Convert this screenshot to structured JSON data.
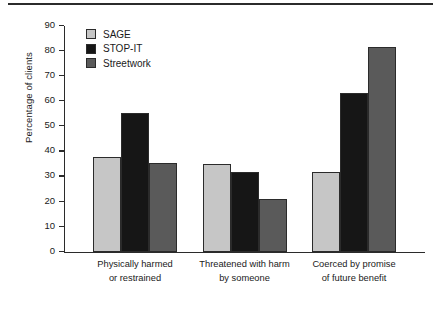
{
  "chart_data": {
    "type": "bar",
    "title": "",
    "xlabel": "",
    "ylabel": "Percentage of clients",
    "ylim": [
      0,
      90
    ],
    "yticks": [
      0,
      10,
      20,
      30,
      40,
      50,
      60,
      70,
      80,
      90
    ],
    "grid": false,
    "legend_position": "top-left inside plot",
    "categories": [
      "Physically  harmed\nor restrained",
      "Threatened with harm\nby someone",
      "Coerced by promise\nof future benefit"
    ],
    "category_lines": [
      [
        "Physically   harmed",
        "or restrained"
      ],
      [
        "Threatened with harm",
        "by someone"
      ],
      [
        "Coerced by promise",
        "of future benefit"
      ]
    ],
    "series": [
      {
        "name": "SAGE",
        "color": "#c6c6c6",
        "values": [
          38,
          35,
          32
        ]
      },
      {
        "name": "STOP-IT",
        "color": "#161616",
        "values": [
          55.5,
          32,
          63.5
        ]
      },
      {
        "name": "Streetwork",
        "color": "#5a5a5a",
        "values": [
          35.5,
          21,
          81.5
        ]
      }
    ]
  },
  "axis": {
    "line_color": "#2b2b2b"
  }
}
